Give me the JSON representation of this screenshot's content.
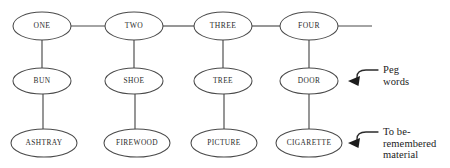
{
  "diagram": {
    "type": "peg-word-mnemonic-chain",
    "canvas": {
      "width": 450,
      "height": 168,
      "background": "#ffffff"
    },
    "stroke_color": "#4a4a4a",
    "text_color": "#2b2b2b",
    "rows": [
      {
        "id": "number-row",
        "cy": 26,
        "rx": 29,
        "ry": 14,
        "font_size": 7.6,
        "nodes": [
          {
            "label": "ONE",
            "cx": 42
          },
          {
            "label": "TWO",
            "cx": 134
          },
          {
            "label": "THREE",
            "cx": 223
          },
          {
            "label": "FOUR",
            "cx": 309
          }
        ]
      },
      {
        "id": "peg-word-row",
        "cy": 81,
        "rx": 29,
        "ry": 13,
        "font_size": 7.4,
        "nodes": [
          {
            "label": "BUN",
            "cx": 42
          },
          {
            "label": "SHOE",
            "cx": 134
          },
          {
            "label": "TREE",
            "cx": 223
          },
          {
            "label": "DOOR",
            "cx": 309
          }
        ]
      },
      {
        "id": "target-material-row",
        "cy": 143,
        "rx": 33,
        "ry": 14,
        "font_size": 7.4,
        "nodes": [
          {
            "label": "ASHTRAY",
            "cx": 44
          },
          {
            "label": "FIREWOOD",
            "cx": 137
          },
          {
            "label": "PICTURE",
            "cx": 224
          },
          {
            "label": "CIGARETTE",
            "cx": 309
          }
        ]
      }
    ],
    "horizontal_links": [
      {
        "from": "ONE",
        "to": "TWO",
        "x1": 71,
        "x2": 105,
        "y": 26
      },
      {
        "from": "TWO",
        "to": "THREE",
        "x1": 163,
        "x2": 194,
        "y": 26
      },
      {
        "from": "THREE",
        "to": "FOUR",
        "x1": 252,
        "x2": 280,
        "y": 26
      },
      {
        "from": "FOUR",
        "to": "",
        "x1": 338,
        "x2": 372,
        "y": 26
      }
    ],
    "vertical_links": [
      {
        "from": "ONE",
        "to": "BUN",
        "x": 42,
        "y1": 40,
        "y2": 68
      },
      {
        "from": "TWO",
        "to": "SHOE",
        "x": 134,
        "y1": 40,
        "y2": 68
      },
      {
        "from": "THREE",
        "to": "TREE",
        "x": 223,
        "y1": 40,
        "y2": 68
      },
      {
        "from": "FOUR",
        "to": "DOOR",
        "x": 309,
        "y1": 40,
        "y2": 68
      },
      {
        "from": "BUN",
        "to": "ASHTRAY",
        "x": 43,
        "y1": 94,
        "y2": 129
      },
      {
        "from": "SHOE",
        "to": "FIREWOOD",
        "x": 135,
        "y1": 94,
        "y2": 129
      },
      {
        "from": "TREE",
        "to": "PICTURE",
        "x": 224,
        "y1": 94,
        "y2": 129
      },
      {
        "from": "DOOR",
        "to": "CIGARETTE",
        "x": 309,
        "y1": 94,
        "y2": 129
      }
    ],
    "annotations": [
      {
        "id": "peg-words",
        "text": "Peg\nwords",
        "points_to": "DOOR",
        "arrow_tip": {
          "x": 348,
          "y": 81
        }
      },
      {
        "id": "to-be-remembered-material",
        "text": "To be-\nremembered\nmaterial",
        "points_to": "CIGARETTE",
        "arrow_tip": {
          "x": 348,
          "y": 143
        }
      }
    ]
  }
}
